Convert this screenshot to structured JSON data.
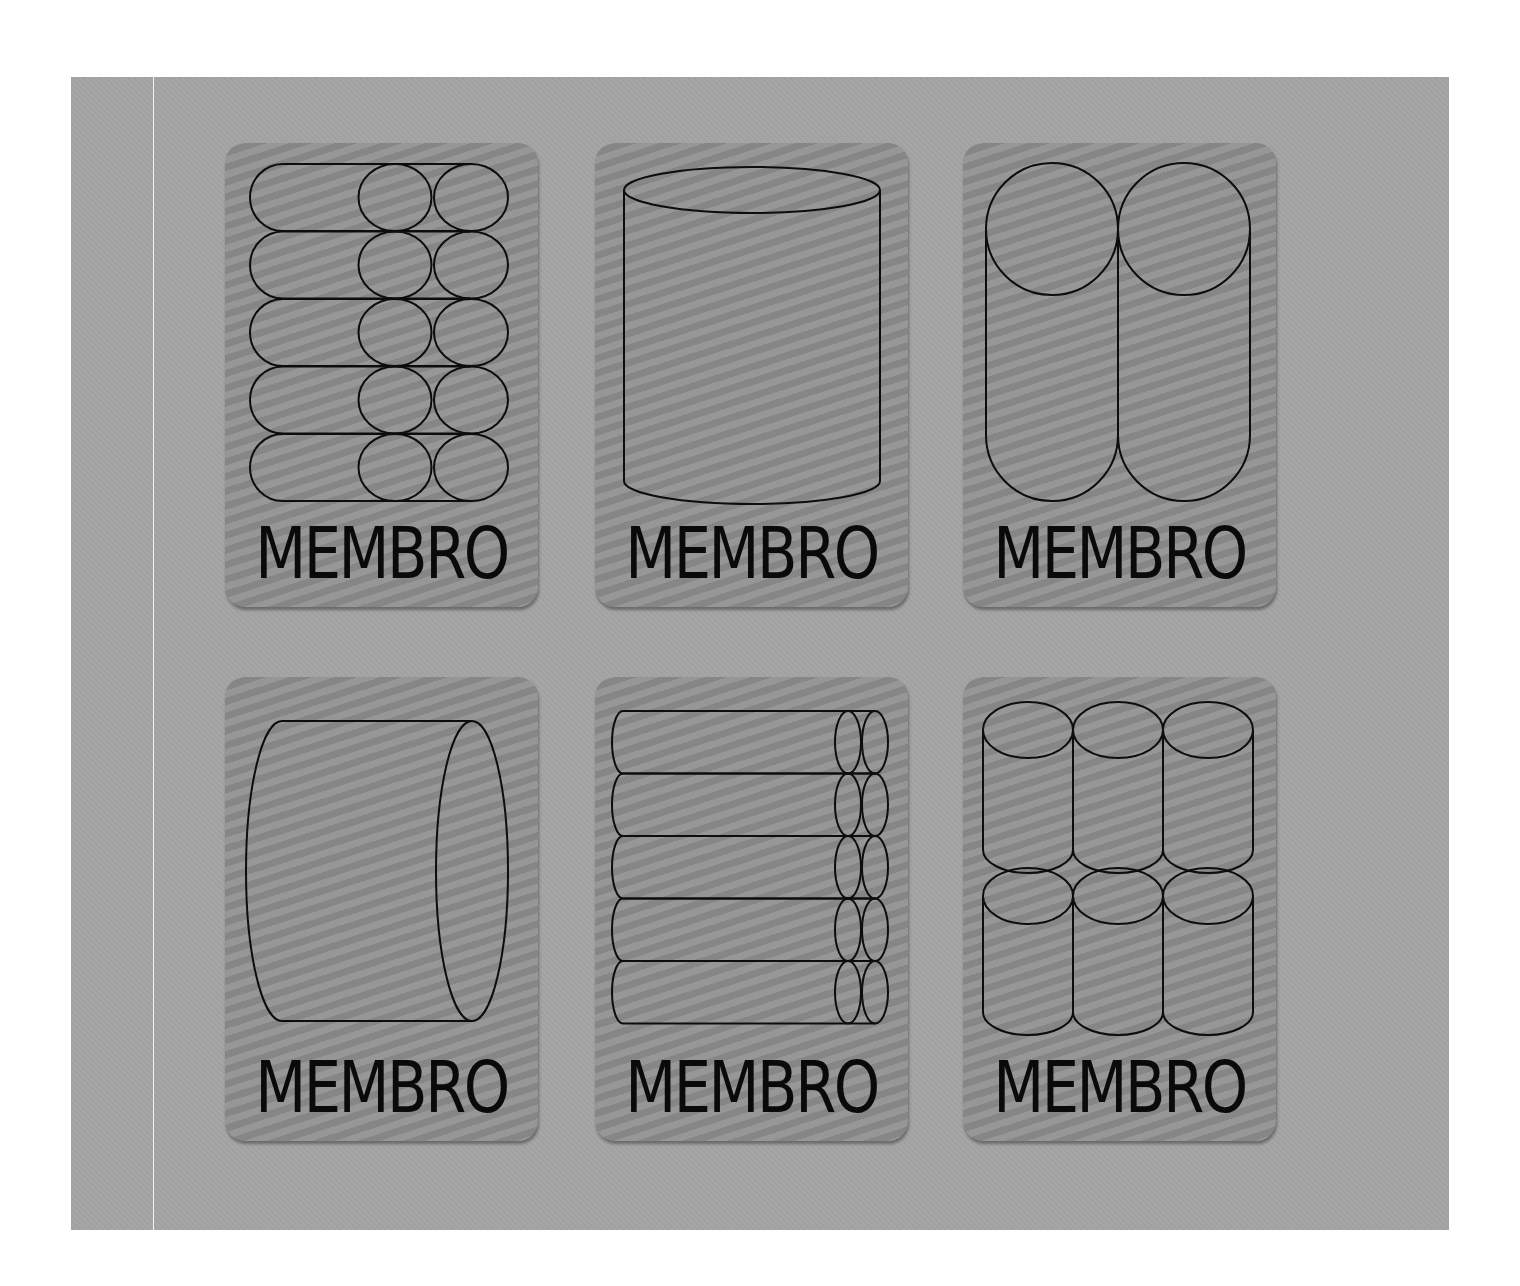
{
  "page": {
    "background_color": "#ffffff",
    "panel_color": "#a4a4a4",
    "card_color": "#909090",
    "stroke_color": "#0d0d0d"
  },
  "cards": [
    {
      "label": "MEMBRO",
      "icon": "horizontal-cylinder-stack-5-rows-icon"
    },
    {
      "label": "MEMBRO",
      "icon": "single-vertical-cylinder-icon"
    },
    {
      "label": "MEMBRO",
      "icon": "two-tall-vertical-cylinders-icon"
    },
    {
      "label": "MEMBRO",
      "icon": "single-horizontal-cylinder-icon"
    },
    {
      "label": "MEMBRO",
      "icon": "horizontal-rod-stack-5-rows-icon"
    },
    {
      "label": "MEMBRO",
      "icon": "vertical-cylinder-grid-3x2-icon"
    }
  ]
}
